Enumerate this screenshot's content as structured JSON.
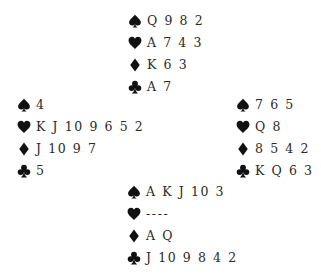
{
  "diagram": {
    "type": "bridge-deal",
    "suit_color": "#111111",
    "hands": {
      "north": {
        "spades": "Q 9 8 2",
        "hearts": "A 7 4 3",
        "diamonds": "K 6 3",
        "clubs": "A 7"
      },
      "west": {
        "spades": "4",
        "hearts": "K J 10 9 6 5 2",
        "diamonds": "J 10 9 7",
        "clubs": "5"
      },
      "east": {
        "spades": "7 6 5",
        "hearts": "Q 8",
        "diamonds": "8 5 4 2",
        "clubs": "K Q 6 3"
      },
      "south": {
        "spades": "A K J 10 3",
        "hearts": "----",
        "diamonds": "A Q",
        "clubs": "J 10 9 8 4 2"
      }
    },
    "icons": {
      "spades": "spade-icon",
      "hearts": "heart-icon",
      "diamonds": "diamond-icon",
      "clubs": "club-icon"
    }
  }
}
